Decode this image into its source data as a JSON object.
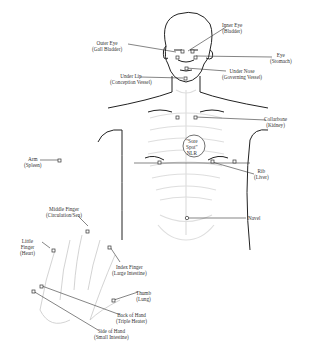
{
  "title": "",
  "colors": {
    "line": "#333333",
    "skeleton": "#dcdcdc",
    "point": "#444444"
  },
  "points": [
    {
      "id": "inner-eye",
      "label": "Inner Eye",
      "organ": "(Bladder)"
    },
    {
      "id": "outer-eye",
      "label": "Outer Eye",
      "organ": "(Gall Bladder)"
    },
    {
      "id": "eye",
      "label": "Eye",
      "organ": "(Stomach)"
    },
    {
      "id": "under-nose",
      "label": "Under Nose",
      "organ": "(Governing Vessel)"
    },
    {
      "id": "under-lip",
      "label": "Under Lip",
      "organ": "(Conception Vessel)"
    },
    {
      "id": "collarbone",
      "label": "Collarbone",
      "organ": "(Kidney)"
    },
    {
      "id": "sore-spot",
      "label": "\"Sore",
      "organ": "Spot\"",
      "extra": "NLR"
    },
    {
      "id": "arm",
      "label": "Arm",
      "organ": "(Spleen)"
    },
    {
      "id": "rib",
      "label": "Rib",
      "organ": "(Liver)"
    },
    {
      "id": "navel",
      "label": "Navel",
      "organ": ""
    },
    {
      "id": "middle-finger",
      "label": "Middle Finger",
      "organ": "(Circulation/Sex)"
    },
    {
      "id": "little-finger",
      "label": "Little",
      "organ": "Finger",
      "extra": "(Heart)"
    },
    {
      "id": "index-finger",
      "label": "Index Finger",
      "organ": "(Large Intestine)"
    },
    {
      "id": "thumb",
      "label": "Thumb",
      "organ": "(Lung)"
    },
    {
      "id": "back-of-hand",
      "label": "Back of Hand",
      "organ": "(Triple Heater)"
    },
    {
      "id": "side-of-hand",
      "label": "Side of Hand",
      "organ": "(Small Intestine)"
    }
  ]
}
